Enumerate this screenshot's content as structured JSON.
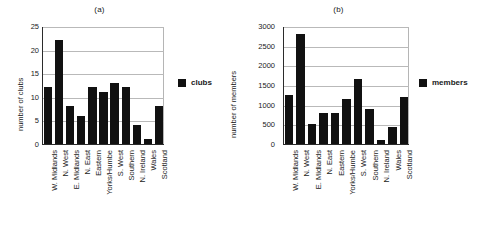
{
  "figure": {
    "panel_a_title": "(a)",
    "panel_b_title": "(b)"
  },
  "chart_data": [
    {
      "type": "bar",
      "title": "(a)",
      "xlabel": "",
      "ylabel": "number of clubs",
      "categories": [
        "W. Midlands",
        "N. West",
        "E. Midlands",
        "N. East",
        "Eastern",
        "Yorks/Humbe",
        "S. West",
        "Southern",
        "N. Ireland",
        "Wales",
        "Scotland"
      ],
      "values": [
        12,
        22,
        8,
        6,
        12,
        11,
        13,
        12,
        4,
        1,
        8
      ],
      "ylim": [
        0,
        25
      ],
      "yticks": [
        0,
        5,
        10,
        15,
        20,
        25
      ],
      "grid": true,
      "legend": [
        "clubs"
      ],
      "legend_position": "right",
      "series_color": "#111111"
    },
    {
      "type": "bar",
      "title": "(b)",
      "xlabel": "",
      "ylabel": "number of members",
      "categories": [
        "W. Midlands",
        "N. West",
        "E. Midlands",
        "N. East",
        "Eastern",
        "Yorks/Humbe",
        "S. West",
        "Southern",
        "N. Ireland",
        "Wales",
        "Scotland"
      ],
      "values": [
        1250,
        2800,
        500,
        800,
        780,
        1150,
        1650,
        900,
        100,
        420,
        1200
      ],
      "ylim": [
        0,
        3000
      ],
      "yticks": [
        0,
        500,
        1000,
        1500,
        2000,
        2500,
        3000
      ],
      "grid": true,
      "legend": [
        "members"
      ],
      "legend_position": "right",
      "series_color": "#111111"
    }
  ]
}
